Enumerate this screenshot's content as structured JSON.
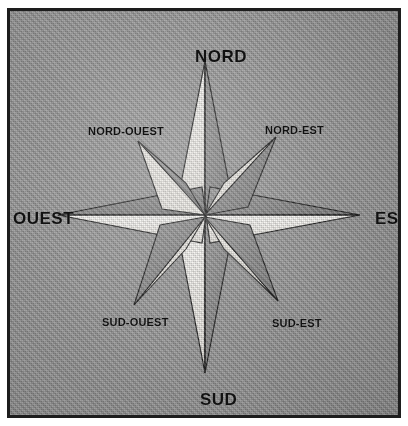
{
  "figure": {
    "background_color": "#9b9b9b",
    "border_color": "#1d1d1d",
    "ink_color": "#111111",
    "facet_light_color": "#f2f0ec",
    "facet_dark_color": "#8a8a8a"
  },
  "compass": {
    "center": {
      "x": 201,
      "y": 206
    },
    "points": [
      {
        "id": "nord",
        "label": "NORD",
        "bearing_deg": 0,
        "type": "cardinal",
        "tip": {
          "x": 201,
          "y": 55
        },
        "light_side": "left"
      },
      {
        "id": "nord-est",
        "label": "NORD-EST",
        "bearing_deg": 45,
        "type": "ordinal",
        "tip": {
          "x": 270,
          "y": 130
        },
        "light_side": "left"
      },
      {
        "id": "est",
        "label": "EST",
        "bearing_deg": 90,
        "type": "cardinal",
        "tip": {
          "x": 355,
          "y": 206
        },
        "light_side": "lower"
      },
      {
        "id": "sud-est",
        "label": "SUD-EST",
        "bearing_deg": 135,
        "type": "ordinal",
        "tip": {
          "x": 272,
          "y": 295
        },
        "light_side": "upper"
      },
      {
        "id": "sud",
        "label": "SUD",
        "bearing_deg": 180,
        "type": "cardinal",
        "tip": {
          "x": 201,
          "y": 368
        },
        "light_side": "left"
      },
      {
        "id": "sud-ouest",
        "label": "SUD-OUEST",
        "bearing_deg": 225,
        "type": "ordinal",
        "tip": {
          "x": 128,
          "y": 298
        },
        "light_side": "upper"
      },
      {
        "id": "ouest",
        "label": "OUEST",
        "bearing_deg": 270,
        "type": "cardinal",
        "tip": {
          "x": 55,
          "y": 206
        },
        "light_side": "lower"
      },
      {
        "id": "nord-ouest",
        "label": "NORD-OUEST",
        "bearing_deg": 315,
        "type": "ordinal",
        "tip": {
          "x": 133,
          "y": 133
        },
        "light_side": "lower"
      }
    ]
  },
  "labels": {
    "nord": "NORD",
    "nord_est": "NORD-EST",
    "est": "EST",
    "sud_est": "SUD-EST",
    "sud": "SUD",
    "sud_ouest": "SUD-OUEST",
    "ouest": "OUEST",
    "nord_ouest": "NORD-OUEST"
  }
}
